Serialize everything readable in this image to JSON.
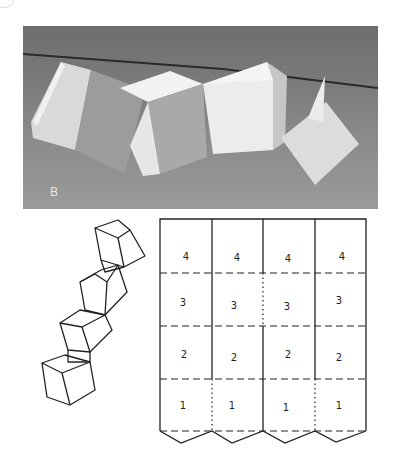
{
  "figure": {
    "photo": {
      "label": "B",
      "description": "Photograph of a folded paper chain of cubes resting on a grey surface"
    },
    "sketch": {
      "description": "Line drawing of four stacked open cubes in a diagonal chain"
    },
    "net": {
      "columns": 4,
      "rows": 4,
      "cell_labels": [
        [
          "4",
          "4",
          "4",
          "4"
        ],
        [
          "3",
          "3",
          "3",
          "3"
        ],
        [
          "2",
          "2",
          "2",
          "2"
        ],
        [
          "1",
          "1",
          "1",
          "1"
        ]
      ],
      "line_style": {
        "cut": "solid",
        "fold_horizontal": "dashed",
        "fold_vertical": "dotted"
      }
    }
  }
}
